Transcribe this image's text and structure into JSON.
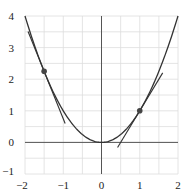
{
  "chart_data": {
    "type": "line",
    "title": "",
    "xlabel": "",
    "ylabel": "",
    "xlim": [
      -2,
      2
    ],
    "ylim": [
      -1,
      4
    ],
    "grid": true,
    "grid_step": 0.5,
    "x_ticks": [
      -2,
      -1,
      0,
      1,
      2
    ],
    "x_tick_labels": [
      "−2",
      "−1",
      "0",
      "1",
      "2"
    ],
    "y_ticks": [
      -1,
      0,
      1,
      2,
      3,
      4
    ],
    "y_tick_labels": [
      "−1",
      "0",
      "1",
      "2",
      "3",
      "4"
    ],
    "series": [
      {
        "name": "y = x^2",
        "kind": "curve",
        "function": "x^2",
        "x_range": [
          -2,
          2
        ]
      },
      {
        "name": "tangent at x = -1.5",
        "kind": "line",
        "slope": -3,
        "intercept": -2.25,
        "x_range": [
          -1.92,
          -0.95
        ]
      },
      {
        "name": "tangent at x = 1",
        "kind": "line",
        "slope": 2,
        "intercept": -1,
        "x_range": [
          0.42,
          1.6
        ]
      }
    ],
    "points": [
      {
        "x": -1.5,
        "y": 2.25
      },
      {
        "x": 1,
        "y": 1
      }
    ],
    "legend": null
  },
  "colors": {
    "curve": "#333333",
    "grid": "#dddddd",
    "axis": "#555555",
    "point": "#444444"
  }
}
